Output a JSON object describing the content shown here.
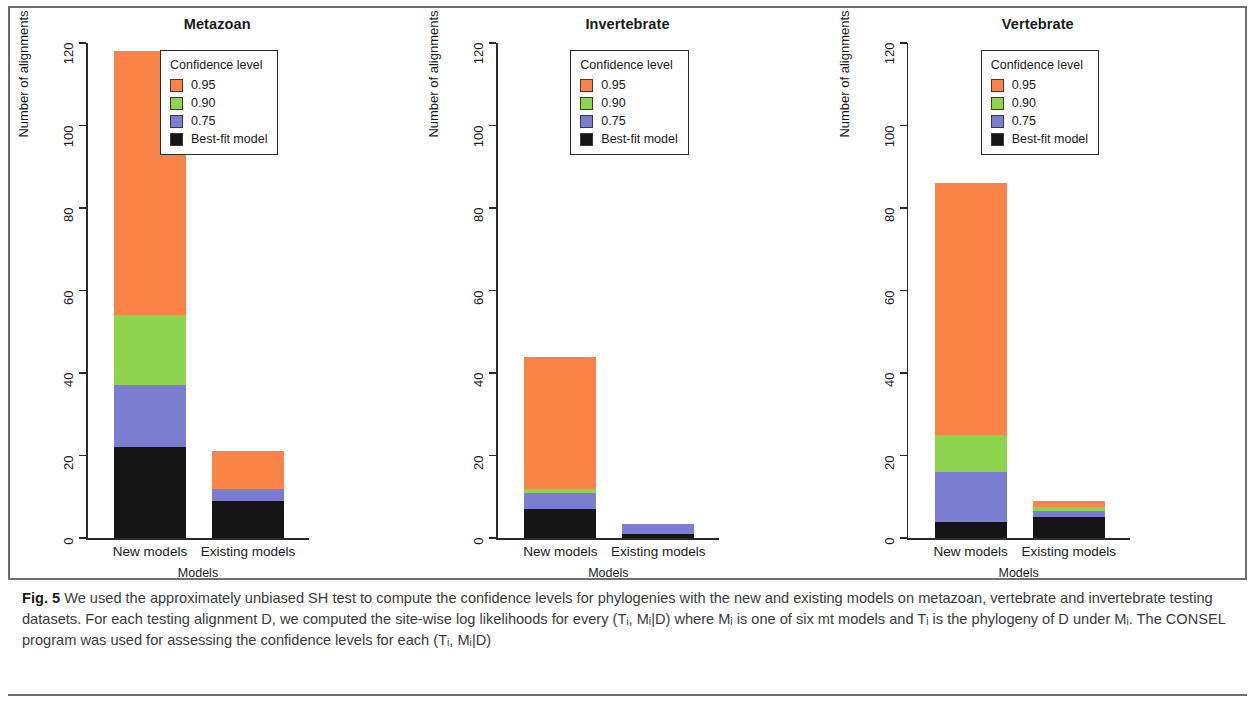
{
  "figure": {
    "caption_label": "Fig. 5",
    "caption_text": " We used the approximately unbiased SH test to compute the confidence levels for phylogenies with the new and existing models on metazoan, vertebrate and invertebrate testing datasets. For each testing alignment D, we computed the site-wise log likelihoods for every (Tᵢ, Mᵢ|D) where Mᵢ is one of six mt models and Tᵢ is the phylogeny of D under Mᵢ. The CONSEL program was used for assessing the confidence levels for each (Tᵢ, Mᵢ|D)"
  },
  "legend": {
    "title": "Confidence level",
    "entries": [
      {
        "label": "0.95",
        "color": "#fa8347"
      },
      {
        "label": "0.90",
        "color": "#8ed44f"
      },
      {
        "label": "0.75",
        "color": "#7b7dd0"
      },
      {
        "label": "Best-fit model",
        "color": "#151515"
      }
    ]
  },
  "chart_data": [
    {
      "type": "bar",
      "stacked": true,
      "title": "Metazoan",
      "xlabel": "Models",
      "ylabel": "Number of alignments",
      "categories": [
        "New models",
        "Existing models"
      ],
      "ylim": [
        0,
        120
      ],
      "yticks": [
        0,
        20,
        40,
        60,
        80,
        100,
        120
      ],
      "grid": false,
      "legend_position": "top-right",
      "series": [
        {
          "name": "Best-fit model",
          "color": "#151515",
          "values": [
            22,
            9
          ]
        },
        {
          "name": "0.75",
          "color": "#7b7dd0",
          "values": [
            15,
            3
          ]
        },
        {
          "name": "0.90",
          "color": "#8ed44f",
          "values": [
            17,
            0
          ]
        },
        {
          "name": "0.95",
          "color": "#fa8347",
          "values": [
            64,
            9
          ]
        }
      ],
      "totals": [
        118,
        21
      ]
    },
    {
      "type": "bar",
      "stacked": true,
      "title": "Invertebrate",
      "xlabel": "Models",
      "ylabel": "Number of alignments",
      "categories": [
        "New models",
        "Existing models"
      ],
      "ylim": [
        0,
        120
      ],
      "yticks": [
        0,
        20,
        40,
        60,
        80,
        100,
        120
      ],
      "grid": false,
      "legend_position": "top-right",
      "series": [
        {
          "name": "Best-fit model",
          "color": "#151515",
          "values": [
            7,
            1
          ]
        },
        {
          "name": "0.75",
          "color": "#7b7dd0",
          "values": [
            4,
            2.5
          ]
        },
        {
          "name": "0.90",
          "color": "#8ed44f",
          "values": [
            1,
            0
          ]
        },
        {
          "name": "0.95",
          "color": "#fa8347",
          "values": [
            32,
            0
          ]
        }
      ],
      "totals": [
        44,
        3.5
      ]
    },
    {
      "type": "bar",
      "stacked": true,
      "title": "Vertebrate",
      "xlabel": "Models",
      "ylabel": "Number of alignments",
      "categories": [
        "New models",
        "Existing models"
      ],
      "ylim": [
        0,
        120
      ],
      "yticks": [
        0,
        20,
        40,
        60,
        80,
        100,
        120
      ],
      "grid": false,
      "legend_position": "top-right",
      "series": [
        {
          "name": "Best-fit model",
          "color": "#151515",
          "values": [
            4,
            5
          ]
        },
        {
          "name": "0.75",
          "color": "#7b7dd0",
          "values": [
            12,
            1.5
          ]
        },
        {
          "name": "0.90",
          "color": "#8ed44f",
          "values": [
            9,
            1
          ]
        },
        {
          "name": "0.95",
          "color": "#fa8347",
          "values": [
            61,
            1.5
          ]
        }
      ],
      "totals": [
        86,
        9
      ]
    }
  ]
}
